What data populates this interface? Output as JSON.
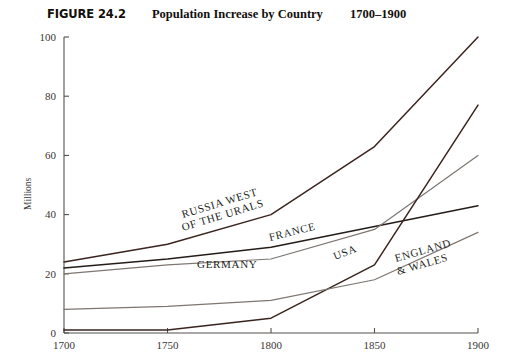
{
  "figure": {
    "number": "FIGURE 24.2",
    "title": "Population Increase by Country",
    "range": "1700–1900"
  },
  "chart_data": {
    "type": "line",
    "title": "Population Increase by Country",
    "subtitle": "1700–1900",
    "xlabel": "",
    "ylabel": "Millions",
    "x": [
      1700,
      1750,
      1800,
      1850,
      1900
    ],
    "xlim": [
      1700,
      1900
    ],
    "ylim": [
      0,
      100
    ],
    "xticks": [
      "1700",
      "1750",
      "1800",
      "1850",
      "1900"
    ],
    "yticks": [
      "0",
      "20",
      "40",
      "60",
      "80",
      "100"
    ],
    "grid": false,
    "legend": "inline-labels",
    "series": [
      {
        "name": "RUSSIA WEST OF THE URALS",
        "label_lines": [
          "RUSSIA WEST",
          "OF THE URALS"
        ],
        "color": "#3a2420",
        "width": 1.5,
        "values": [
          24,
          30,
          40,
          63,
          100
        ]
      },
      {
        "name": "FRANCE",
        "label_lines": [
          "FRANCE"
        ],
        "color": "#241c18",
        "width": 1.5,
        "values": [
          22,
          25,
          29,
          36,
          43
        ]
      },
      {
        "name": "GERMANY",
        "label_lines": [
          "GERMANY"
        ],
        "color": "#7d7671",
        "width": 1.2,
        "values": [
          20,
          23,
          25,
          35,
          60
        ]
      },
      {
        "name": "USA",
        "label_lines": [
          "USA"
        ],
        "color": "#3a2420",
        "width": 1.5,
        "values": [
          1,
          1,
          5,
          23,
          77
        ]
      },
      {
        "name": "ENGLAND & WALES",
        "label_lines": [
          "ENGLAND",
          "& WALES"
        ],
        "color": "#7d7671",
        "width": 1.2,
        "values": [
          8,
          9,
          11,
          18,
          34
        ]
      }
    ],
    "annotations": [
      {
        "text": "RUSSIA WEST",
        "x": 183,
        "y": 218,
        "rotate": -17
      },
      {
        "text": "OF THE URALS",
        "x": 183,
        "y": 231,
        "rotate": -17
      },
      {
        "text": "FRANCE",
        "x": 270,
        "y": 241,
        "rotate": -14
      },
      {
        "text": "GERMANY",
        "x": 197,
        "y": 268,
        "rotate": 0
      },
      {
        "text": "USA",
        "x": 335,
        "y": 260,
        "rotate": -21
      },
      {
        "text": "ENGLAND",
        "x": 396,
        "y": 262,
        "rotate": -16
      },
      {
        "text": "& WALES",
        "x": 398,
        "y": 275,
        "rotate": -16
      }
    ]
  }
}
